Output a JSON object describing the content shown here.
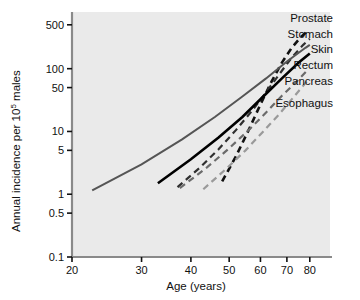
{
  "chart_data": {
    "type": "line",
    "title": "",
    "xlabel": "Age (years)",
    "ylabel": "Annual incidence per 10⁵ males",
    "ylabel_main": "Annual incidence per 10",
    "ylabel_sup": "5",
    "ylabel_tail": " males",
    "xscale": "log",
    "yscale": "log",
    "xlim": [
      20,
      90
    ],
    "ylim": [
      0.1,
      800
    ],
    "grid": false,
    "legend_position": "right-inline-labels",
    "xticks": [
      20,
      30,
      40,
      50,
      60,
      70,
      80
    ],
    "xtick_labels": [
      "20",
      "30",
      "40",
      "50",
      "60",
      "70",
      "80"
    ],
    "yticks": [
      0.1,
      0.5,
      1,
      5,
      10,
      50,
      100,
      500
    ],
    "ytick_labels": [
      "0.1",
      "0.5",
      "1",
      "5",
      "10",
      "50",
      "100",
      "500"
    ],
    "plot_background": "#eaeaea",
    "series": [
      {
        "name": "Prostate",
        "color": "#111111",
        "style": "dashed",
        "width": 2.6,
        "x": [
          48,
          52,
          56,
          60,
          64,
          68,
          72,
          76,
          79
        ],
        "y": [
          1.6,
          4.0,
          10.5,
          27,
          62,
          125,
          215,
          320,
          400
        ]
      },
      {
        "name": "Stomach",
        "color": "#2f2f2f",
        "style": "dashed",
        "width": 2.2,
        "x": [
          37,
          42,
          47,
          52,
          57,
          62,
          67,
          72,
          77,
          80
        ],
        "y": [
          1.3,
          2.6,
          5.2,
          10.5,
          21,
          42,
          82,
          150,
          240,
          300
        ]
      },
      {
        "name": "Skin",
        "color": "#555555",
        "style": "solid",
        "width": 2.0,
        "x": [
          22.5,
          30,
          38,
          46,
          54,
          62,
          70,
          78,
          80
        ],
        "y": [
          1.15,
          3.0,
          7.5,
          17,
          36,
          70,
          130,
          215,
          240
        ]
      },
      {
        "name": "Rectum",
        "color": "#000000",
        "style": "solid",
        "width": 2.6,
        "x": [
          33,
          40,
          47,
          54,
          61,
          68,
          75,
          80
        ],
        "y": [
          1.5,
          3.6,
          8.0,
          17,
          36,
          70,
          125,
          175
        ]
      },
      {
        "name": "Pancreas",
        "color": "#6b6b6b",
        "style": "dashed",
        "width": 2.2,
        "x": [
          37.5,
          44,
          50,
          56,
          62,
          68,
          74,
          79
        ],
        "y": [
          1.25,
          2.7,
          5.4,
          10.5,
          20,
          37,
          62,
          95
        ]
      },
      {
        "name": "Esophagus",
        "color": "#9a9a9a",
        "style": "dashed",
        "width": 2.2,
        "x": [
          43,
          49,
          55,
          61,
          67,
          73,
          79
        ],
        "y": [
          1.2,
          2.5,
          5.0,
          10.0,
          19,
          36,
          65
        ]
      }
    ],
    "annotations": [
      {
        "text": "Prostate",
        "x": 333,
        "y": 22
      },
      {
        "text": "Stomach",
        "x": 333,
        "y": 38
      },
      {
        "text": "Skin",
        "x": 333,
        "y": 53
      },
      {
        "text": "Rectum",
        "x": 333,
        "y": 69
      },
      {
        "text": "Pancreas",
        "x": 333,
        "y": 85
      },
      {
        "text": "Esophagus",
        "x": 333,
        "y": 107
      }
    ]
  }
}
